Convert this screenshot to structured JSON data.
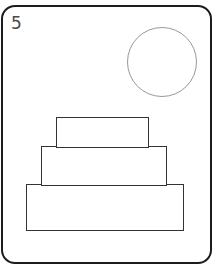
{
  "card": {
    "number": "5",
    "shapes": [
      {
        "type": "circle",
        "stroke": "#999999"
      },
      {
        "type": "rectangle",
        "tier": "top",
        "stroke": "#333333"
      },
      {
        "type": "rectangle",
        "tier": "middle",
        "stroke": "#333333"
      },
      {
        "type": "rectangle",
        "tier": "bottom",
        "stroke": "#333333"
      }
    ]
  }
}
